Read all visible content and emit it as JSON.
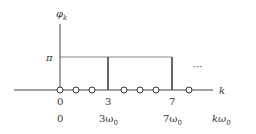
{
  "diagram": {
    "type": "phase spectrum (stem plot)",
    "y_axis_label": "φ",
    "y_axis_subscript": "k",
    "x_axis_label": "k",
    "freq_axis_label": "kω",
    "freq_axis_subscript": "0",
    "level_label": "π",
    "ellipsis": "···",
    "tick_labels_k": [
      "0",
      "3",
      "7"
    ],
    "tick_labels_freq": [
      {
        "text": "0",
        "sub": ""
      },
      {
        "text": "3ω",
        "sub": "0"
      },
      {
        "text": "7ω",
        "sub": "0"
      }
    ],
    "points": [
      {
        "k": 0,
        "phi": "0",
        "marker": "circle"
      },
      {
        "k": 1,
        "phi": "0",
        "marker": "circle"
      },
      {
        "k": 2,
        "phi": "0",
        "marker": "circle"
      },
      {
        "k": 3,
        "phi": "π",
        "marker": "stem"
      },
      {
        "k": 4,
        "phi": "0",
        "marker": "circle"
      },
      {
        "k": 5,
        "phi": "0",
        "marker": "circle"
      },
      {
        "k": 6,
        "phi": "0",
        "marker": "circle"
      },
      {
        "k": 7,
        "phi": "π",
        "marker": "stem"
      },
      {
        "k": 8,
        "phi": "0",
        "marker": "circle"
      }
    ]
  }
}
